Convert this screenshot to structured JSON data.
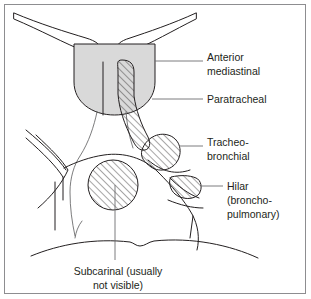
{
  "figure": {
    "border_color": "#8d8d90",
    "background_color": "#ffffff",
    "ink_color": "#231f20"
  },
  "labels": [
    {
      "id": "anterior-mediastinal",
      "line1": "Anterior",
      "line2": "mediastinal",
      "line3": "",
      "x": 207,
      "y": 58
    },
    {
      "id": "paratracheal",
      "line1": "Paratracheal",
      "line2": "",
      "line3": "",
      "x": 207,
      "y": 99
    },
    {
      "id": "tracheobronchial",
      "line1": "Tracheo-",
      "line2": "bronchial",
      "line3": "",
      "x": 207,
      "y": 143
    },
    {
      "id": "hilar",
      "line1": "Hilar",
      "line2": "(broncho-",
      "line3": "pulmonary)",
      "x": 227,
      "y": 183
    }
  ],
  "caption": {
    "line1": "Subcarinal (usually",
    "line2": "not visible)",
    "x": 118,
    "y1": 272,
    "y2": 287
  },
  "regions": {
    "anterior_mediastinal": {
      "name": "Anterior mediastinal",
      "fill": "#d9d9d9",
      "style": "solid-gray-shading"
    },
    "paratracheal": {
      "name": "Paratracheal",
      "fill": "#ffffff",
      "style": "diagonal-hatch"
    },
    "tracheobronchial": {
      "name": "Tracheobronchial",
      "fill": "#ffffff",
      "style": "diagonal-hatch"
    },
    "hilar": {
      "name": "Hilar (bronchopulmonary)",
      "fill": "#ffffff",
      "style": "diagonal-hatch"
    },
    "subcarinal": {
      "name": "Subcarinal",
      "fill": "#ffffff",
      "style": "diagonal-hatch"
    }
  }
}
